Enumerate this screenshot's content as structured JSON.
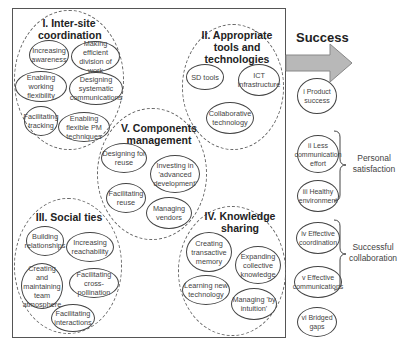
{
  "diagram": {
    "groups": [
      {
        "id": "I",
        "title": "I. Inter-site coordination",
        "items": [
          "Increasing awareness",
          "Making efficient division of work",
          "Enabling working flexibility",
          "Designing systematic communications",
          "Facilitating tracking",
          "Enabling flexible PM techniques"
        ]
      },
      {
        "id": "II",
        "title": "II. Appropriate tools and technologies",
        "items": [
          "SD tools",
          "ICT infrastructure",
          "Collaborative technology"
        ]
      },
      {
        "id": "III",
        "title": "III. Social ties",
        "items": [
          "Building relationships",
          "Increasing reachability",
          "Creating and maintaining team atmosphere",
          "Facilitating cross-pollination",
          "Facilitating interactions"
        ]
      },
      {
        "id": "IV",
        "title": "IV. Knowledge sharing",
        "items": [
          "Creating transactive memory",
          "Expanding collective knowledge",
          "Learning new technology",
          "Managing 'by intuition'"
        ]
      },
      {
        "id": "V",
        "title": "V. Components management",
        "items": [
          "Designing for reuse",
          "Investing in 'advanced development'",
          "Facilitating reuse",
          "Managing vendors"
        ]
      }
    ],
    "success": {
      "title": "Success",
      "outcomes": [
        "i Product success",
        "ii Less communication effort",
        "iii Healthy environment",
        "iv Effective coordination",
        "v Effective communications",
        "vi Bridged gaps"
      ],
      "brackets": [
        {
          "label": "Personal satisfaction",
          "covers": [
            "ii",
            "iii"
          ]
        },
        {
          "label": "Successful collaboration",
          "covers": [
            "iv",
            "v"
          ]
        }
      ]
    },
    "colors": {
      "arrow_fill": "#b8b8b8",
      "arrow_stroke": "#888888",
      "line": "#444444"
    }
  }
}
